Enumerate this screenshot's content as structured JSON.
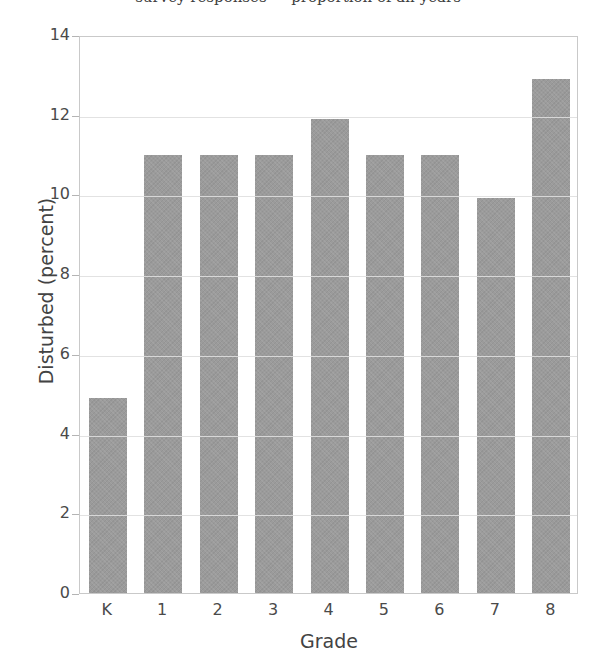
{
  "figure": {
    "top_caption_fragment": "survey responses  —  proportion of all years",
    "background_color": "#ffffff"
  },
  "chart_data": {
    "type": "bar",
    "title": "",
    "xlabel": "Grade",
    "ylabel": "Disturbed (percent)",
    "categories": [
      "K",
      "1",
      "2",
      "3",
      "4",
      "5",
      "6",
      "7",
      "8"
    ],
    "values": [
      4.9,
      11.0,
      11.0,
      11.0,
      11.9,
      11.0,
      11.0,
      9.9,
      12.9
    ],
    "ylim": [
      0,
      14
    ],
    "ytick_labels": [
      "0",
      "2",
      "4",
      "6",
      "8",
      "10",
      "12",
      "14"
    ],
    "ytick_values": [
      0,
      2,
      4,
      6,
      8,
      10,
      12,
      14
    ],
    "grid": "horizontal",
    "legend": "none",
    "bar_color": "#9b9b9b",
    "grid_color": "#e2e2e2",
    "frame_color": "#c9c9c9",
    "text_color": "#4a4a4a"
  }
}
